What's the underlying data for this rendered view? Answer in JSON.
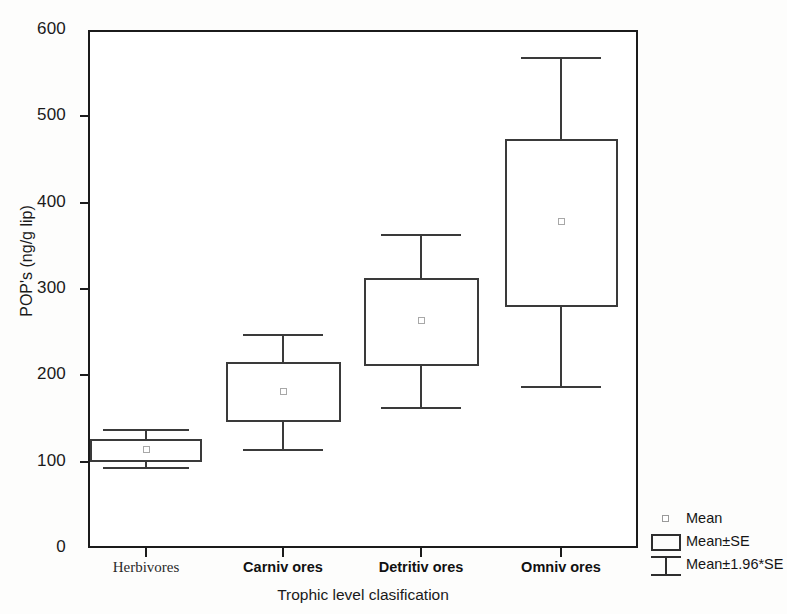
{
  "chart_data": {
    "type": "box",
    "title": "",
    "xlabel": "Trophic level clasification",
    "ylabel": "POP's (ng/g lip)",
    "ylim": [
      0,
      600
    ],
    "yticks": [
      0,
      100,
      200,
      300,
      400,
      500,
      600
    ],
    "ytick_labels": [
      "0",
      "100",
      "200",
      "300",
      "400",
      "500",
      "600"
    ],
    "grid": false,
    "categories": [
      "Herbivores",
      "Carniv ores",
      "Detritiv ores",
      "Omniv ores"
    ],
    "legend_position": "right-bottom",
    "series": [
      {
        "name": "Herbivores",
        "mean": 114,
        "box_low": 100,
        "box_high": 126,
        "whisker_low": 93,
        "whisker_high": 137
      },
      {
        "name": "Carniv ores",
        "mean": 181,
        "box_low": 146,
        "box_high": 215,
        "whisker_low": 113,
        "whisker_high": 247
      },
      {
        "name": "Detritiv ores",
        "mean": 263,
        "box_low": 211,
        "box_high": 313,
        "whisker_low": 162,
        "whisker_high": 362
      },
      {
        "name": "Omniv ores",
        "mean": 378,
        "box_low": 279,
        "box_high": 474,
        "whisker_low": 186,
        "whisker_high": 567
      }
    ],
    "legend": [
      {
        "label": "Mean",
        "marker": "point"
      },
      {
        "label": "Mean±SE",
        "marker": "box"
      },
      {
        "label": "Mean±1.96*SE",
        "marker": "whisker"
      }
    ],
    "colors": {
      "axis": "#1b1b1b",
      "box_outline": "#3a3a3a",
      "mean_marker": "#a8a8a8",
      "background": "#ffffff"
    }
  }
}
